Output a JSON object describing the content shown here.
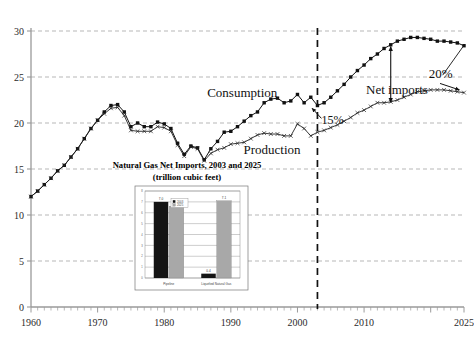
{
  "chart_data": [
    {
      "type": "line",
      "title": "",
      "xlabel": "",
      "ylabel": "",
      "xlim": [
        1960,
        2025
      ],
      "ylim": [
        0,
        30
      ],
      "ytick_labels": [
        "0",
        "5",
        "10",
        "15",
        "20",
        "25",
        "30"
      ],
      "ytick_values": [
        0,
        5,
        10,
        15,
        20,
        25,
        30
      ],
      "xtick_labels": [
        "1960",
        "1970",
        "1980",
        "1990",
        "2000",
        "2010",
        "2025"
      ],
      "xtick_values": [
        1960,
        1970,
        1980,
        1990,
        2000,
        2010,
        2025
      ],
      "grid": true,
      "legend": "inline-labels",
      "annotations": [
        {
          "text": "Consumption",
          "x": 1993,
          "y": 22.8
        },
        {
          "text": "Production",
          "x": 1996,
          "y": 17.1
        },
        {
          "text": "Net imports",
          "x": 2015,
          "y": 23.6
        },
        {
          "text": "15%",
          "x": 2004,
          "y": 20.3
        },
        {
          "text": "20%",
          "x": 2023,
          "y": 24.6
        }
      ],
      "projection_divider_year": 2003,
      "series": [
        {
          "name": "Consumption",
          "marker": "filled-square",
          "x": [
            1960,
            1961,
            1962,
            1963,
            1964,
            1965,
            1966,
            1967,
            1968,
            1969,
            1970,
            1971,
            1972,
            1973,
            1974,
            1975,
            1976,
            1977,
            1978,
            1979,
            1980,
            1981,
            1982,
            1983,
            1984,
            1985,
            1986,
            1987,
            1988,
            1989,
            1990,
            1991,
            1992,
            1993,
            1994,
            1995,
            1996,
            1997,
            1998,
            1999,
            2000,
            2001,
            2002,
            2003,
            2004,
            2005,
            2006,
            2007,
            2008,
            2009,
            2010,
            2011,
            2012,
            2013,
            2014,
            2015,
            2016,
            2017,
            2018,
            2019,
            2020,
            2021,
            2022,
            2023,
            2024,
            2025
          ],
          "values": [
            12.0,
            12.6,
            13.3,
            14.0,
            14.8,
            15.4,
            16.3,
            17.2,
            18.3,
            19.4,
            20.3,
            21.2,
            21.9,
            22.0,
            21.2,
            19.6,
            20.0,
            19.6,
            19.6,
            20.1,
            19.9,
            19.4,
            17.8,
            16.6,
            17.5,
            17.3,
            16.0,
            17.2,
            18.0,
            19.0,
            19.1,
            19.6,
            20.2,
            20.8,
            21.2,
            22.2,
            22.6,
            22.7,
            22.2,
            22.4,
            23.1,
            22.2,
            22.8,
            21.9,
            22.2,
            22.8,
            23.5,
            24.2,
            25.0,
            25.7,
            26.3,
            27.0,
            27.5,
            28.1,
            28.5,
            28.9,
            29.1,
            29.3,
            29.3,
            29.2,
            29.1,
            28.9,
            28.9,
            28.8,
            28.7,
            28.4
          ]
        },
        {
          "name": "Production",
          "marker": "cross",
          "x": [
            1960,
            1961,
            1962,
            1963,
            1964,
            1965,
            1966,
            1967,
            1968,
            1969,
            1970,
            1971,
            1972,
            1973,
            1974,
            1975,
            1976,
            1977,
            1978,
            1979,
            1980,
            1981,
            1982,
            1983,
            1984,
            1985,
            1986,
            1987,
            1988,
            1989,
            1990,
            1991,
            1992,
            1993,
            1994,
            1995,
            1996,
            1997,
            1998,
            1999,
            2000,
            2001,
            2002,
            2003,
            2004,
            2005,
            2006,
            2007,
            2008,
            2009,
            2010,
            2011,
            2012,
            2013,
            2014,
            2015,
            2016,
            2017,
            2018,
            2019,
            2020,
            2021,
            2022,
            2023,
            2024,
            2025
          ],
          "values": [
            12.0,
            12.6,
            13.3,
            14.0,
            14.8,
            15.4,
            16.3,
            17.2,
            18.3,
            19.4,
            20.3,
            21.0,
            21.6,
            21.7,
            20.8,
            19.2,
            19.1,
            19.1,
            19.1,
            19.6,
            19.5,
            19.1,
            17.6,
            16.4,
            17.4,
            17.2,
            15.9,
            16.7,
            17.1,
            17.3,
            17.7,
            17.8,
            17.9,
            18.3,
            18.7,
            18.9,
            18.8,
            18.8,
            18.6,
            18.6,
            19.9,
            19.4,
            18.6,
            19.0,
            19.2,
            19.5,
            19.8,
            20.2,
            20.6,
            21.1,
            21.4,
            21.8,
            22.2,
            22.2,
            22.3,
            22.5,
            22.8,
            23.1,
            23.4,
            23.5,
            23.6,
            23.6,
            23.6,
            23.5,
            23.4,
            23.3
          ]
        }
      ]
    },
    {
      "type": "bar",
      "title": "Natural Gas Net Imports, 2003 and 2025",
      "subtitle": "(trillion cubic feet)",
      "categories": [
        "Pipeline",
        "Liquefied Natural Gas"
      ],
      "ylim": [
        0,
        8
      ],
      "ytick_labels": [
        "0",
        "1",
        "2",
        "3",
        "4",
        "5",
        "6",
        "7",
        "8"
      ],
      "series": [
        {
          "name": "2003",
          "color": "#141414",
          "values": [
            7.0,
            0.4
          ],
          "value_labels": [
            "7.0",
            "0.4"
          ]
        },
        {
          "name": "2025",
          "color": "#a8a8a8",
          "values": [
            6.6,
            7.1
          ],
          "value_labels": [
            "6.6",
            "7.1"
          ]
        }
      ],
      "legend": [
        "2003",
        "2025"
      ],
      "legend_position": "top-left"
    }
  ],
  "main_chart": {
    "y_ticks": [
      "30",
      "25",
      "20",
      "15",
      "10",
      "5",
      "0"
    ],
    "x_ticks": [
      "1960",
      "1970",
      "1980",
      "1990",
      "2000",
      "2010",
      "2025"
    ],
    "labels": {
      "consumption": "Consumption",
      "production": "Production",
      "net_imports": "Net imports",
      "pct_15": "15%",
      "pct_20": "20%"
    }
  },
  "inset_chart": {
    "title_line1": "Natural Gas Net Imports, 2003 and 2025",
    "title_line2": "(trillion cubic feet)",
    "legend": {
      "s1": "2003",
      "s2": "2025"
    },
    "categories": {
      "c1": "Pipeline",
      "c2": "Liquefied Natural Gas"
    },
    "value_labels": {
      "p2003": "7.0",
      "p2025": "6.6",
      "l2003": "0.4",
      "l2025": "7.1"
    },
    "y_ticks": {
      "t0": "0",
      "t1": "1",
      "t2": "2",
      "t3": "3",
      "t4": "4",
      "t5": "5",
      "t6": "6",
      "t7": "7",
      "t8": "8"
    }
  },
  "colors": {
    "series_consumption": "#111111",
    "series_production": "#222222",
    "grid": "#9a9a9a",
    "axis": "#9a9a9a",
    "divider": "#111111",
    "bar_2003": "#141414",
    "bar_2025": "#a8a8a8"
  }
}
